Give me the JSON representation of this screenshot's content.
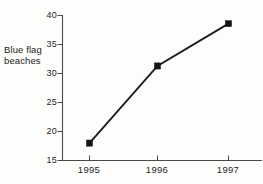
{
  "chart_data": {
    "type": "line",
    "title": "",
    "xlabel": "",
    "ylabel": "Blue flag beaches",
    "ylabel_lines": [
      "Blue flag",
      "beaches"
    ],
    "categories": [
      "1995",
      "1996",
      "1997"
    ],
    "values": [
      18.0,
      31.3,
      38.6
    ],
    "series": [
      {
        "name": "Blue flag beaches",
        "values": [
          18.0,
          31.3,
          38.6
        ]
      }
    ],
    "ylim": [
      15,
      40
    ],
    "yticks": [
      40,
      35,
      30,
      25,
      20,
      15
    ],
    "ytick_labels": [
      "40",
      "35",
      "30",
      "25",
      "20",
      "15"
    ],
    "xtick_labels": [
      "1995",
      "1996",
      "1997"
    ],
    "grid": false,
    "legend": "none",
    "marker": "filled-square",
    "line_color": "#1c1c1c",
    "marker_color": "#141414",
    "axis_color": "#4a4a4a",
    "background_color": "#fdfdfc"
  },
  "axis": {
    "y_label_line1": "Blue flag",
    "y_label_line2": "beaches"
  }
}
